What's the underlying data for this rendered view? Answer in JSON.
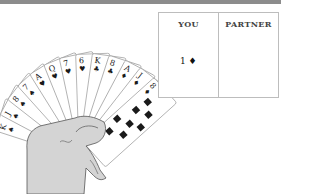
{
  "bidding": {
    "columns": [
      {
        "label": "YOU",
        "bids": [
          {
            "level": "1",
            "suit": "♦"
          }
        ]
      },
      {
        "label": "PARTNER",
        "bids": []
      }
    ],
    "you_bid_text": "1 ♦"
  },
  "hand": {
    "cards": [
      {
        "rank": "K",
        "suit": "♠"
      },
      {
        "rank": "J",
        "suit": "♠"
      },
      {
        "rank": "8",
        "suit": "♠"
      },
      {
        "rank": "7",
        "suit": "♠"
      },
      {
        "rank": "A",
        "suit": "♥"
      },
      {
        "rank": "Q",
        "suit": "♥"
      },
      {
        "rank": "7",
        "suit": "♥"
      },
      {
        "rank": "6",
        "suit": "♥"
      },
      {
        "rank": "K",
        "suit": "♣"
      },
      {
        "rank": "8",
        "suit": "♣"
      },
      {
        "rank": "A",
        "suit": "♦"
      },
      {
        "rank": "J",
        "suit": "♦"
      },
      {
        "rank": "8",
        "suit": "♦"
      }
    ]
  },
  "colors": {
    "top_bar": "#8c8c8c",
    "card_outline": "#9a9a9a",
    "hand_fill": "#d4d4d4",
    "ink": "#1a1a1a"
  }
}
